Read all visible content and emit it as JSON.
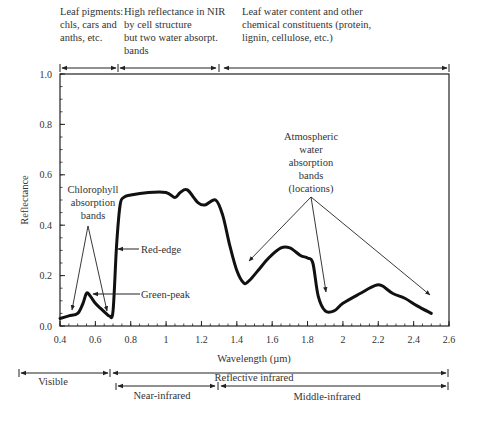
{
  "chart_data": {
    "type": "line",
    "title": "",
    "xlabel": "Wavelength (µm)",
    "ylabel": "Reflectance",
    "xlim": [
      0.4,
      2.6
    ],
    "ylim": [
      0.0,
      1.0
    ],
    "x_ticks": [
      "0.4",
      "0.6",
      "0.8",
      "1",
      "1.2",
      "1.4",
      "1.6",
      "1.8",
      "2",
      "2.2",
      "2.4",
      "2.6"
    ],
    "y_ticks": [
      "0.0",
      "0.2",
      "0.4",
      "0.6",
      "0.8",
      "1.0"
    ],
    "grid": false,
    "series": [
      {
        "name": "Vegetation reflectance",
        "x": [
          0.4,
          0.45,
          0.5,
          0.53,
          0.55,
          0.57,
          0.6,
          0.63,
          0.66,
          0.68,
          0.7,
          0.72,
          0.74,
          0.76,
          0.8,
          0.9,
          1.0,
          1.05,
          1.08,
          1.12,
          1.18,
          1.22,
          1.28,
          1.32,
          1.36,
          1.4,
          1.44,
          1.47,
          1.52,
          1.58,
          1.65,
          1.7,
          1.76,
          1.8,
          1.83,
          1.86,
          1.9,
          1.95,
          2.0,
          2.1,
          2.18,
          2.22,
          2.28,
          2.35,
          2.42,
          2.5
        ],
        "y": [
          0.03,
          0.04,
          0.05,
          0.09,
          0.13,
          0.12,
          0.09,
          0.07,
          0.05,
          0.04,
          0.06,
          0.32,
          0.48,
          0.51,
          0.52,
          0.53,
          0.53,
          0.51,
          0.53,
          0.54,
          0.49,
          0.48,
          0.5,
          0.44,
          0.32,
          0.22,
          0.17,
          0.18,
          0.22,
          0.27,
          0.31,
          0.31,
          0.28,
          0.27,
          0.25,
          0.12,
          0.06,
          0.06,
          0.09,
          0.13,
          0.16,
          0.16,
          0.13,
          0.11,
          0.08,
          0.05
        ]
      }
    ],
    "annotations": [
      {
        "text": "Chlorophyll absorption bands",
        "points_to_x": [
          0.48,
          0.68
        ]
      },
      {
        "text": "Green-peak",
        "points_to_x": 0.56
      },
      {
        "text": "Red-edge",
        "points_to_x": 0.72
      },
      {
        "text": "Atmospheric water absorption bands (locations)",
        "points_to_x": [
          1.45,
          1.92,
          2.5
        ]
      }
    ],
    "top_ranges": [
      {
        "label": "Leaf pigments: chls, cars and anths, etc.",
        "from": 0.4,
        "to": 0.72
      },
      {
        "label": "High reflectance in NIR by cell structure but two water absorpt. bands",
        "from": 0.73,
        "to": 1.3
      },
      {
        "label": "Leaf water content and other chemical constituents (protein, lignin, cellulose, etc.)",
        "from": 1.32,
        "to": 2.6
      }
    ],
    "bottom_ranges": [
      {
        "label": "Visible",
        "from": 0.4,
        "to": 0.7
      },
      {
        "label": "Reflective infrared",
        "from": 0.7,
        "to": 2.6
      },
      {
        "label": "Near-infrared",
        "from": 0.7,
        "to": 1.3
      },
      {
        "label": "Middle-infrared",
        "from": 1.3,
        "to": 2.6
      }
    ]
  },
  "labels": {
    "top1_l1": "Leaf pigments:",
    "top1_l2": "chls, cars and",
    "top1_l3": "anths, etc.",
    "top2_l1": "High reflectance in NIR",
    "top2_l2": "by cell structure",
    "top2_l3": "but two water absorpt.",
    "top2_l4": "bands",
    "top3_l1": "Leaf water content and other",
    "top3_l2": "chemical constituents (protein,",
    "top3_l3": "lignin, cellulose, etc.)",
    "chl_l1": "Chlorophyll",
    "chl_l2": "absorption",
    "chl_l3": "bands",
    "green_peak": "Green-peak",
    "red_edge": "Red-edge",
    "atm_l1": "Atmospheric",
    "atm_l2": "water",
    "atm_l3": "absorption",
    "atm_l4": "bands",
    "atm_l5": "(locations)",
    "xlabel": "Wavelength (µm)",
    "ylabel": "Reflectance",
    "visible": "Visible",
    "reflective_ir": "Reflective infrared",
    "near_ir": "Near-infrared",
    "middle_ir": "Middle-infrared"
  }
}
